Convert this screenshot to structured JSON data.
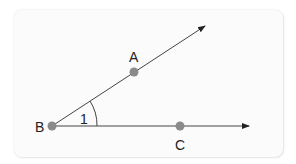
{
  "diagram": {
    "type": "geometry-angle",
    "points": [
      {
        "id": "A",
        "label": "A",
        "x": 134,
        "y": 72
      },
      {
        "id": "B",
        "label": "B",
        "x": 52,
        "y": 126
      },
      {
        "id": "C",
        "label": "C",
        "x": 180,
        "y": 126
      }
    ],
    "rays": [
      {
        "from": "B",
        "through": "A",
        "end": [
          205,
          26
        ]
      },
      {
        "from": "B",
        "through": "C",
        "end": [
          249,
          126
        ]
      }
    ],
    "angle": {
      "vertex": "B",
      "label": "1"
    },
    "colors": {
      "point": "#8a8a8a",
      "line": "#333333",
      "panel": "#fbfbfb"
    }
  }
}
